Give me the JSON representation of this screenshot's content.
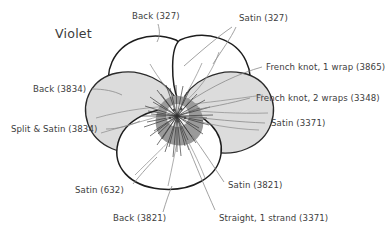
{
  "figure": {
    "title": "Violet"
  },
  "colors": {
    "ink": "#3d3d3d",
    "outline_dark": "#1a1a1a",
    "outline_light": "#6e6e6e",
    "petal_white": "#ffffff",
    "petal_gray": "#dcdcdc",
    "petal_gray_dark": "#d2d2d2",
    "center_gray": "#9a9a9a",
    "center_light": "#f2f2f2",
    "leader": "#8a8a8a",
    "background": "#ffffff"
  },
  "labels": [
    {
      "id": "back-327",
      "text": "Back (327)"
    },
    {
      "id": "satin-327",
      "text": "Satin (327)"
    },
    {
      "id": "french-knot-1-wrap",
      "text": "French knot, 1 wrap (3865)"
    },
    {
      "id": "french-knot-2-wraps",
      "text": "French knot, 2 wraps (3348)"
    },
    {
      "id": "satin-3371",
      "text": "Satin (3371)"
    },
    {
      "id": "back-3834",
      "text": "Back (3834)"
    },
    {
      "id": "split-satin-3834",
      "text": "Split & Satin (3834)"
    },
    {
      "id": "satin-632",
      "text": "Satin (632)"
    },
    {
      "id": "back-3821",
      "text": "Back (3821)"
    },
    {
      "id": "satin-3821",
      "text": "Satin (3821)"
    },
    {
      "id": "straight-1-strand",
      "text": "Straight, 1 strand (3371)"
    }
  ]
}
